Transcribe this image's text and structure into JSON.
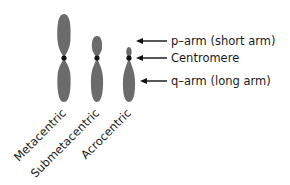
{
  "diagram": {
    "chromosome_color": "#6b6b6b",
    "centromere_color": "#111111",
    "chromosomes": [
      {
        "name": "Metacentric",
        "cx": 64,
        "top": 14,
        "bottom": 102,
        "centromere_y": 58,
        "half_width": 6.5
      },
      {
        "name": "Submetacentric",
        "cx": 97,
        "top": 36,
        "bottom": 102,
        "centromere_y": 58,
        "half_width": 6
      },
      {
        "name": "Acrocentric",
        "cx": 129,
        "top": 47,
        "bottom": 102,
        "centromere_y": 58,
        "half_width": 6
      }
    ],
    "annotations": [
      {
        "label": "p–arm (short arm)",
        "y": 41
      },
      {
        "label": "Centromere",
        "y": 58
      },
      {
        "label": "q–arm (long arm)",
        "y": 81
      }
    ]
  }
}
